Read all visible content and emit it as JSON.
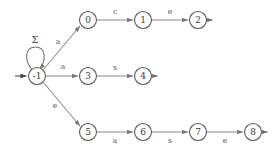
{
  "diagram": {
    "kind": "finite-state-automaton",
    "title": "",
    "canvas": {
      "width": 276,
      "height": 147
    },
    "colors": {
      "background": "#ffffff",
      "node_stroke": "#5a5a5a",
      "node_fill": "#ffffff",
      "node_text": "#3a3a3a",
      "edge": "#8c8c8c",
      "edge_label": "#555555",
      "start_arrow": "#4a4a4a"
    },
    "nodes": [
      {
        "id": "start",
        "label": "-1",
        "x": 37,
        "y": 76,
        "r": 8.5,
        "is_start": true,
        "is_accepting": false
      },
      {
        "id": "n0",
        "label": "0",
        "x": 88,
        "y": 20,
        "r": 8.5,
        "is_start": false,
        "is_accepting": false
      },
      {
        "id": "n1",
        "label": "1",
        "x": 143,
        "y": 20,
        "r": 8.5,
        "is_start": false,
        "is_accepting": false
      },
      {
        "id": "n2",
        "label": "2",
        "x": 198,
        "y": 20,
        "r": 8.5,
        "is_start": false,
        "is_accepting": true
      },
      {
        "id": "n3",
        "label": "3",
        "x": 88,
        "y": 76,
        "r": 8.5,
        "is_start": false,
        "is_accepting": false
      },
      {
        "id": "n4",
        "label": "4",
        "x": 143,
        "y": 76,
        "r": 8.5,
        "is_start": false,
        "is_accepting": true
      },
      {
        "id": "n5",
        "label": "5",
        "x": 88,
        "y": 132,
        "r": 8.5,
        "is_start": false,
        "is_accepting": false
      },
      {
        "id": "n6",
        "label": "6",
        "x": 143,
        "y": 132,
        "r": 8.5,
        "is_start": false,
        "is_accepting": false
      },
      {
        "id": "n7",
        "label": "7",
        "x": 198,
        "y": 132,
        "r": 8.5,
        "is_start": false,
        "is_accepting": false
      },
      {
        "id": "n8",
        "label": "8",
        "x": 253,
        "y": 132,
        "r": 8.5,
        "is_start": false,
        "is_accepting": true
      }
    ],
    "edges": [
      {
        "from": "start",
        "to": "start",
        "label": "Σ",
        "kind": "self-loop",
        "label_x": 35,
        "label_y": 40
      },
      {
        "from": "start",
        "to": "n0",
        "label": "a",
        "kind": "diagonal-up",
        "label_x": 58,
        "label_y": 42
      },
      {
        "from": "start",
        "to": "n3",
        "label": "a",
        "kind": "straight",
        "label_x": 63,
        "label_y": 67
      },
      {
        "from": "start",
        "to": "n5",
        "label": "e",
        "kind": "diagonal-down",
        "label_x": 55,
        "label_y": 106
      },
      {
        "from": "n0",
        "to": "n1",
        "label": "c",
        "kind": "straight",
        "label_x": 115,
        "label_y": 12
      },
      {
        "from": "n1",
        "to": "n2",
        "label": "e",
        "kind": "straight",
        "label_x": 170,
        "label_y": 12
      },
      {
        "from": "n3",
        "to": "n4",
        "label": "s",
        "kind": "straight",
        "label_x": 115,
        "label_y": 68
      },
      {
        "from": "n5",
        "to": "n6",
        "label": "a",
        "kind": "straight",
        "label_x": 115,
        "label_y": 141
      },
      {
        "from": "n6",
        "to": "n7",
        "label": "s",
        "kind": "straight",
        "label_x": 170,
        "label_y": 141
      },
      {
        "from": "n7",
        "to": "n8",
        "label": "e",
        "kind": "straight",
        "label_x": 225,
        "label_y": 141
      }
    ],
    "alphabet_symbols": [
      "a",
      "c",
      "e",
      "s",
      "Σ"
    ]
  }
}
